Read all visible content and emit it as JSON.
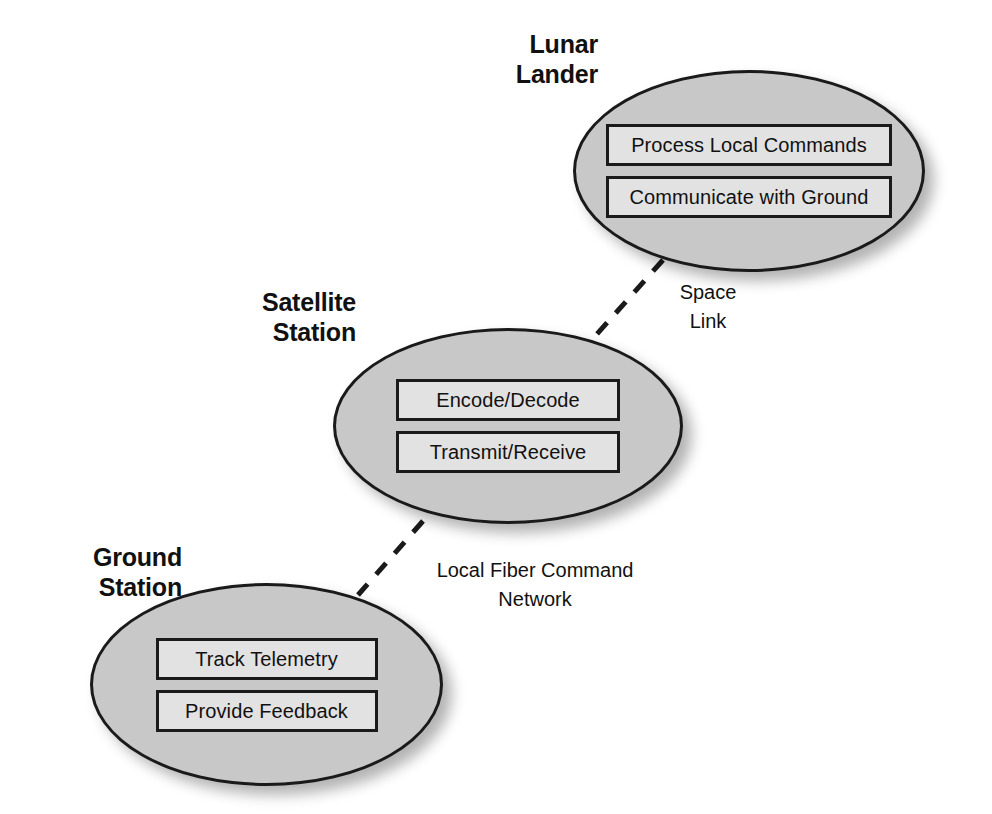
{
  "diagram": {
    "background_color": "#ffffff",
    "node_fill_color": "#c8c8c8",
    "node_border_color": "#1a1a1a",
    "component_fill_color": "#e2e2e2",
    "text_color": "#111111"
  },
  "nodes": [
    {
      "id": "lunar-lander",
      "title": "Lunar\nLander",
      "components": [
        {
          "label": "Process Local Commands"
        },
        {
          "label": "Communicate with Ground"
        }
      ]
    },
    {
      "id": "satellite-station",
      "title": "Satellite\nStation",
      "components": [
        {
          "label": "Encode/Decode"
        },
        {
          "label": "Transmit/Receive"
        }
      ]
    },
    {
      "id": "ground-station",
      "title": "Ground\nStation",
      "components": [
        {
          "label": "Track Telemetry"
        },
        {
          "label": "Provide Feedback"
        }
      ]
    }
  ],
  "links": [
    {
      "id": "space-link",
      "label": "Space\nLink",
      "from": "satellite-station",
      "to": "lunar-lander",
      "style": "dashed"
    },
    {
      "id": "local-fiber-command-network",
      "label": "Local Fiber Command\nNetwork",
      "from": "ground-station",
      "to": "satellite-station",
      "style": "dashed"
    }
  ]
}
